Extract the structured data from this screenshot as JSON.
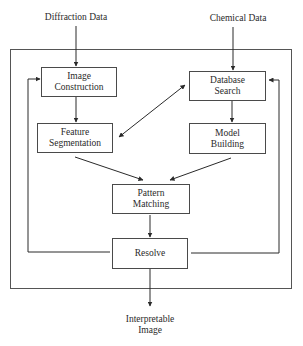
{
  "diagram": {
    "inputs": {
      "diffraction": "Diffraction Data",
      "chemical": "Chemical Data"
    },
    "nodes": {
      "image_construction": {
        "line1": "Image",
        "line2": "Construction"
      },
      "database_search": {
        "line1": "Database",
        "line2": "Search"
      },
      "feature_segmentation": {
        "line1": "Feature",
        "line2": "Segmentation"
      },
      "model_building": {
        "line1": "Model",
        "line2": "Building"
      },
      "pattern_matching": {
        "line1": "Pattern",
        "line2": "Matching"
      },
      "resolve": {
        "line1": "Resolve"
      }
    },
    "output": {
      "line1": "Interpretable",
      "line2": "Image"
    },
    "edges": [
      {
        "from": "Diffraction Data",
        "to": "Image Construction",
        "type": "arrow"
      },
      {
        "from": "Chemical Data",
        "to": "Database Search",
        "type": "arrow"
      },
      {
        "from": "Image Construction",
        "to": "Feature Segmentation",
        "type": "arrow"
      },
      {
        "from": "Database Search",
        "to": "Model Building",
        "type": "arrow"
      },
      {
        "from": "Feature Segmentation",
        "to": "Database Search",
        "type": "bidirectional"
      },
      {
        "from": "Feature Segmentation",
        "to": "Pattern Matching",
        "type": "arrow"
      },
      {
        "from": "Model Building",
        "to": "Pattern Matching",
        "type": "arrow"
      },
      {
        "from": "Pattern Matching",
        "to": "Resolve",
        "type": "arrow"
      },
      {
        "from": "Resolve",
        "to": "Image Construction",
        "type": "feedback"
      },
      {
        "from": "Resolve",
        "to": "Database Search",
        "type": "feedback"
      },
      {
        "from": "Resolve",
        "to": "Interpretable Image",
        "type": "arrow"
      }
    ],
    "colors": {
      "line": "#3a3a3a",
      "background": "#ffffff",
      "text": "#2a2a2a"
    }
  }
}
